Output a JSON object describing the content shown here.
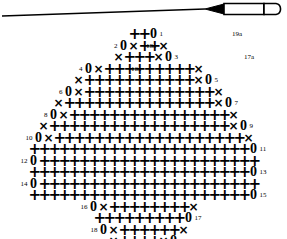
{
  "document": {
    "title": "Crochet Stitch Chart",
    "background_color": "#ffffff",
    "ink_color": "#000000"
  },
  "hook": {
    "label": "crochet hook illustration",
    "shaft_color": "#000000",
    "body_fill": "#ffffff"
  },
  "legend_symbols": {
    "sc": "+",
    "slip_stitch": "×",
    "chain": "0"
  },
  "chart_data": {
    "type": "table",
    "symbol_key": {
      "+": "single crochet",
      "x": "slip stitch / decrease",
      "0": "chain"
    },
    "rows": [
      {
        "left_label": "",
        "right_label": "19",
        "symbols": [
          "x",
          "+",
          "+",
          "+",
          "+",
          "x",
          "0"
        ]
      },
      {
        "left_label": "18",
        "right_label": "",
        "symbols": [
          "0",
          "x",
          "+",
          "+",
          "+",
          "+",
          "+",
          "+",
          "x"
        ]
      },
      {
        "left_label": "",
        "right_label": "17",
        "symbols": [
          "+",
          "+",
          "+",
          "+",
          "+",
          "+",
          "+",
          "+",
          "+",
          "0"
        ]
      },
      {
        "left_label": "16",
        "right_label": "",
        "symbols": [
          "0",
          "x",
          "+",
          "+",
          "+",
          "+",
          "+",
          "+",
          "+",
          "+",
          "x"
        ]
      },
      {
        "left_label": "",
        "right_label": "15",
        "symbols": [
          "+",
          "+",
          "+",
          "+",
          "+",
          "+",
          "+",
          "+",
          "+",
          "+",
          "+",
          "+",
          "+",
          "+",
          "+",
          "+",
          "+",
          "+",
          "+",
          "+",
          "+",
          "+",
          "0"
        ]
      },
      {
        "left_label": "14",
        "right_label": "",
        "symbols": [
          "0",
          "+",
          "+",
          "+",
          "+",
          "+",
          "+",
          "+",
          "+",
          "+",
          "+",
          "+",
          "+",
          "+",
          "+",
          "+",
          "+",
          "+",
          "+",
          "+",
          "+",
          "+",
          "+"
        ]
      },
      {
        "left_label": "",
        "right_label": "13",
        "symbols": [
          "+",
          "+",
          "+",
          "+",
          "+",
          "+",
          "+",
          "+",
          "+",
          "+",
          "+",
          "+",
          "+",
          "+",
          "+",
          "+",
          "+",
          "+",
          "+",
          "+",
          "+",
          "+",
          "0"
        ]
      },
      {
        "left_label": "12",
        "right_label": "",
        "symbols": [
          "0",
          "+",
          "+",
          "+",
          "+",
          "+",
          "+",
          "+",
          "+",
          "+",
          "+",
          "+",
          "+",
          "+",
          "+",
          "+",
          "+",
          "+",
          "+",
          "+",
          "+",
          "+",
          "+"
        ]
      },
      {
        "left_label": "",
        "right_label": "11",
        "symbols": [
          "+",
          "+",
          "+",
          "+",
          "+",
          "+",
          "+",
          "+",
          "+",
          "+",
          "+",
          "+",
          "+",
          "+",
          "+",
          "+",
          "+",
          "+",
          "+",
          "+",
          "+",
          "+",
          "0"
        ]
      },
      {
        "left_label": "10",
        "right_label": "",
        "symbols": [
          "0",
          "x",
          "+",
          "+",
          "+",
          "+",
          "+",
          "+",
          "+",
          "+",
          "+",
          "+",
          "+",
          "+",
          "+",
          "+",
          "+",
          "+",
          "+",
          "+",
          "+",
          "x"
        ]
      },
      {
        "left_label": "",
        "right_label": "9",
        "symbols": [
          "x",
          "+",
          "+",
          "+",
          "+",
          "+",
          "+",
          "+",
          "+",
          "+",
          "+",
          "+",
          "+",
          "+",
          "+",
          "+",
          "+",
          "+",
          "+",
          "x",
          "0"
        ]
      },
      {
        "left_label": "8",
        "right_label": "",
        "symbols": [
          "0",
          "x",
          "+",
          "+",
          "+",
          "+",
          "+",
          "+",
          "+",
          "+",
          "+",
          "+",
          "+",
          "+",
          "+",
          "+",
          "+",
          "+",
          "x"
        ]
      },
      {
        "left_label": "",
        "right_label": "7",
        "symbols": [
          "x",
          "+",
          "+",
          "+",
          "+",
          "+",
          "+",
          "+",
          "+",
          "+",
          "+",
          "+",
          "+",
          "+",
          "+",
          "+",
          "x",
          "0"
        ]
      },
      {
        "left_label": "6",
        "right_label": "",
        "symbols": [
          "0",
          "x",
          "+",
          "+",
          "+",
          "+",
          "+",
          "+",
          "+",
          "+",
          "+",
          "+",
          "+",
          "+",
          "+",
          "x"
        ]
      },
      {
        "left_label": "",
        "right_label": "5",
        "symbols": [
          "x",
          "+",
          "+",
          "+",
          "+",
          "+",
          "+",
          "+",
          "+",
          "+",
          "+",
          "+",
          "x",
          "0"
        ]
      },
      {
        "left_label": "4",
        "right_label": "",
        "symbols": [
          "0",
          "x",
          "+",
          "+",
          "+",
          "+",
          "+",
          "+",
          "+",
          "+",
          "+",
          "x"
        ]
      },
      {
        "left_label": "",
        "right_label": "3",
        "symbols": [
          "x",
          "+",
          "+",
          "+",
          "x",
          "0"
        ]
      },
      {
        "left_label": "2",
        "right_label": "",
        "symbols": [
          "0",
          "x",
          "+",
          "+",
          "x"
        ]
      },
      {
        "left_label": "",
        "right_label": "1",
        "symbols": [
          "+",
          "+",
          "0"
        ]
      }
    ],
    "mirror_labels": {
      "row19a": "19a",
      "row18a": "18a",
      "row17a": "17a",
      "row16a": "16a"
    },
    "foundation_chain_loops": 2
  }
}
